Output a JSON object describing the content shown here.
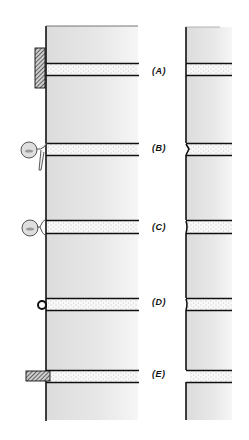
{
  "colors": {
    "line": "#111111",
    "panel_fill": "#e6e6e6",
    "joint_fill": "#f8f8f8",
    "joint_dots": "#888888",
    "hatch": "#333333",
    "bulb_fill": "#d8d8d8"
  },
  "joints": [
    {
      "label": "(A)",
      "detail": "hatched cover strip",
      "top_y": 63,
      "bottom_y": 75,
      "label_y": 66
    },
    {
      "label": "(B)",
      "detail": "bulb gasket with tail",
      "top_y": 143,
      "bottom_y": 155,
      "label_y": 143
    },
    {
      "label": "(C)",
      "detail": "bulb gasket with flanges",
      "top_y": 220,
      "bottom_y": 233,
      "label_y": 222
    },
    {
      "label": "(D)",
      "detail": "hollow round bead",
      "top_y": 298,
      "bottom_y": 310,
      "label_y": 297
    },
    {
      "label": "(E)",
      "detail": "hatched insert strip",
      "top_y": 370,
      "bottom_y": 382,
      "label_y": 369
    }
  ]
}
